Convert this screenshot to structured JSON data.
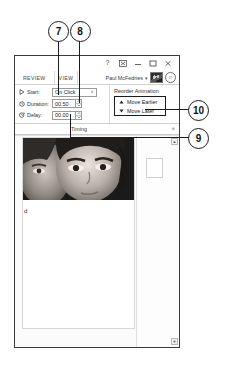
{
  "callouts": [
    {
      "number": "7"
    },
    {
      "number": "8"
    },
    {
      "number": "10"
    },
    {
      "number": "9"
    }
  ],
  "window": {
    "titlebar": {
      "help_label": "?",
      "ribbon_display_options_label": "ribbon-display-options",
      "minimize_label": "minimize",
      "restore_label": "restore",
      "close_label": "close"
    },
    "tabs": [
      {
        "label": "REVIEW"
      },
      {
        "label": "VIEW"
      }
    ],
    "account": {
      "name": "Paul McFedries",
      "caret": "▾",
      "share_label": "share"
    },
    "ribbon": {
      "timing": {
        "caption": "Timing",
        "collapse_chevron": "˄",
        "rows": [
          {
            "icon": "play-icon",
            "label": "Start:",
            "value": "On Click",
            "control": "combo",
            "caret": "˅"
          },
          {
            "icon": "clock-icon",
            "label": "Duration:",
            "value": "00.50",
            "control": "spinner"
          },
          {
            "icon": "delay-clock-icon",
            "label": "Delay:",
            "value": "00.00",
            "control": "spinner"
          }
        ]
      },
      "reorder": {
        "title": "Reorder Animation",
        "buttons": [
          {
            "glyph": "▲",
            "label": "Move Earlier"
          },
          {
            "glyph": "▼",
            "label": "Move Later"
          }
        ]
      }
    },
    "document": {
      "slide_text": "d",
      "scroll_up": "▲",
      "scroll_down": "▼"
    }
  }
}
